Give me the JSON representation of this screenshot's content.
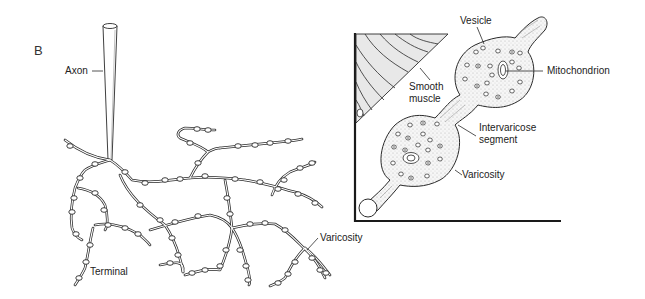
{
  "figure": {
    "panel_letter": "B",
    "left_panel": {
      "title": "Sympathetic nerve terminal network",
      "labels": {
        "axon": "Axon",
        "terminal": "Terminal",
        "varicosity": "Varicosity"
      }
    },
    "right_panel": {
      "title": "Varicosity detail",
      "labels": {
        "vesicle": "Vesicle",
        "mitochondrion": "Mitochondrion",
        "smooth_muscle_line1": "Smooth",
        "smooth_muscle_line2": "muscle",
        "intervaricose_line1": "Intervaricose",
        "intervaricose_line2": "segment",
        "varicosity": "Varicosity"
      }
    },
    "colors": {
      "line": "#2a2a2a",
      "fill": "#f2f2f2",
      "background": "#ffffff"
    }
  }
}
